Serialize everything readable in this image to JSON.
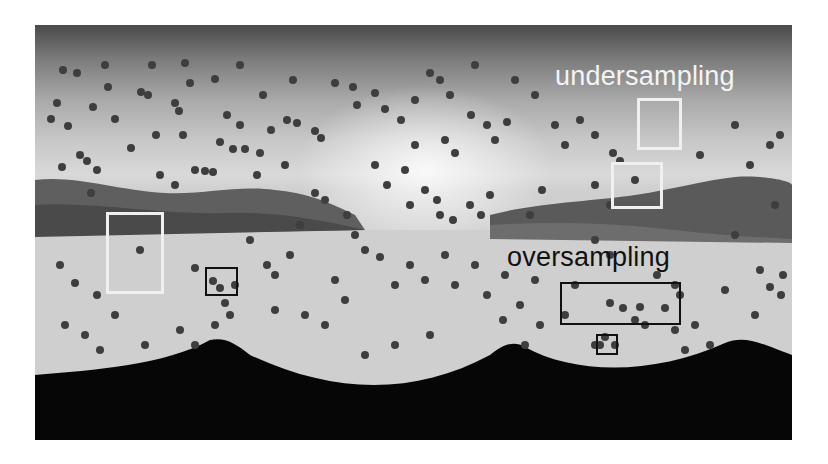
{
  "image": {
    "description": "Equirectangular panorama of a mountain landscape with scattered sample points, annotated regions of undersampling and oversampling",
    "colors": {
      "points": "#3c3c3c",
      "undersampling_box": "#f0f0f0",
      "oversampling_box": "#111111",
      "bottom_shadow": "#050505"
    }
  },
  "annotations": {
    "undersampling": {
      "label": "undersampling",
      "boxes": [
        {
          "x": 637,
          "y": 98,
          "w": 45,
          "h": 52
        },
        {
          "x": 611,
          "y": 162,
          "w": 52,
          "h": 47
        },
        {
          "x": 106,
          "y": 212,
          "w": 58,
          "h": 82
        }
      ]
    },
    "oversampling": {
      "label": "oversampling",
      "boxes": [
        {
          "x": 560,
          "y": 282,
          "w": 121,
          "h": 43
        },
        {
          "x": 205,
          "y": 267,
          "w": 33,
          "h": 29
        },
        {
          "x": 596,
          "y": 334,
          "w": 22,
          "h": 21
        }
      ]
    }
  }
}
